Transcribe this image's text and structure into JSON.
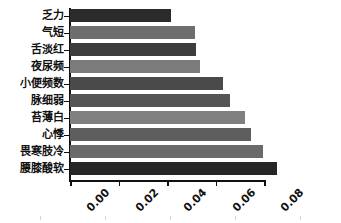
{
  "chart_data": {
    "type": "bar",
    "orientation": "horizontal",
    "title": "",
    "xlabel": "",
    "ylabel": "",
    "xlim": [
      0.0,
      0.08
    ],
    "grid": false,
    "legend": null,
    "xticks": [
      "0.00",
      "0.02",
      "0.04",
      "0.06",
      "0.08"
    ],
    "xtick_values": [
      0.0,
      0.02,
      0.04,
      0.06,
      0.08
    ],
    "categories": [
      "乏力",
      "气短",
      "舌淡红",
      "夜尿频",
      "小便频数",
      "脉细弱",
      "苔薄白",
      "心悸",
      "畏寒肢冷",
      "腰膝酸软"
    ],
    "values": [
      0.0416,
      0.0515,
      0.0518,
      0.0535,
      0.0629,
      0.066,
      0.0722,
      0.0747,
      0.0794,
      0.0855
    ],
    "colors": [
      "#2b2b2b",
      "#6e6e6e",
      "#3d3d3d",
      "#7b7b7b",
      "#4a4a4a",
      "#555555",
      "#808080",
      "#5e5e5e",
      "#6a6a6a",
      "#262626"
    ]
  }
}
